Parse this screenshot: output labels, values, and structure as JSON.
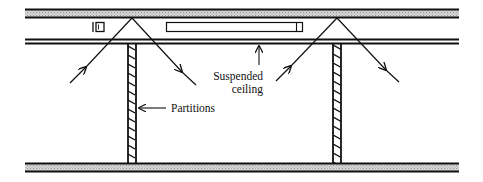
{
  "diagram": {
    "labels": {
      "suspended_line1": "Suspended",
      "suspended_line2": "ceiling",
      "partitions": "Partitions"
    },
    "colors": {
      "line": "#111111",
      "slab_fill": "#bdbdbd",
      "background": "#ffffff"
    },
    "elements": [
      {
        "name": "upper-floor-slab",
        "type": "hatched-slab"
      },
      {
        "name": "suspended-ceiling",
        "type": "double-line"
      },
      {
        "name": "lower-floor-slab",
        "type": "hatched-slab"
      },
      {
        "name": "left-partition",
        "type": "hatched-wall"
      },
      {
        "name": "right-partition",
        "type": "hatched-wall"
      },
      {
        "name": "light-fixture-small",
        "type": "fixture"
      },
      {
        "name": "light-fixture-long",
        "type": "fixture"
      },
      {
        "name": "left-sound-path",
        "type": "arrow-pair"
      },
      {
        "name": "right-sound-path",
        "type": "arrow-pair"
      }
    ]
  }
}
